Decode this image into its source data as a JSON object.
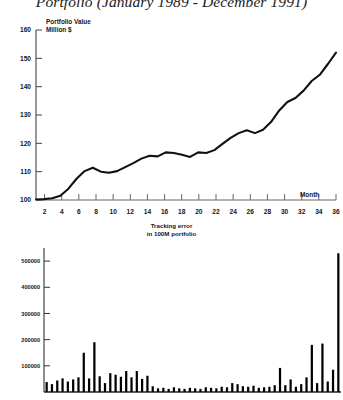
{
  "title": "Portfolio (January 1989 - December 1991)",
  "caption": {
    "line1": "Tracking error",
    "line2": "in 100M portfolio"
  },
  "colors": {
    "ink": "#111111",
    "axis": "#555555",
    "bar": "#000000",
    "background": "#ffffff"
  },
  "chart_data": [
    {
      "type": "line",
      "title": "Portfolio (January 1989 - December 1991)",
      "ylabel_line1": "Portfolio Value",
      "ylabel_line2": "Million $",
      "xlabel": "Month",
      "grid": false,
      "legend": "none",
      "xlim": [
        1,
        36
      ],
      "ylim": [
        100,
        160
      ],
      "yticks": [
        100,
        110,
        120,
        130,
        140,
        150,
        160
      ],
      "xticks": [
        2,
        4,
        6,
        8,
        10,
        12,
        14,
        16,
        18,
        20,
        22,
        24,
        26,
        28,
        30,
        32,
        34,
        36
      ],
      "x": [
        1,
        2,
        3,
        4,
        5,
        6,
        7,
        8,
        9,
        10,
        11,
        12,
        13,
        14,
        15,
        16,
        17,
        18,
        19,
        20,
        21,
        22,
        23,
        24,
        25,
        26,
        27,
        28,
        29,
        30,
        31,
        32,
        33,
        34,
        35,
        36
      ],
      "values": [
        100.2,
        100.3,
        100.6,
        101.5,
        104.0,
        107.5,
        110.2,
        111.4,
        110.0,
        109.6,
        110.2,
        111.6,
        113.0,
        114.6,
        115.6,
        115.4,
        116.8,
        116.6,
        116.0,
        115.2,
        116.8,
        116.6,
        117.6,
        119.8,
        121.9,
        123.6,
        124.6,
        123.6,
        124.8,
        127.6,
        131.6,
        134.6,
        136.0,
        138.6,
        142.0,
        144.2,
        148.0,
        152.0
      ],
      "series_name": "Portfolio Value"
    },
    {
      "type": "bar",
      "title": "Tracking error in 100M portfolio",
      "ylabel": "",
      "xlabel": "",
      "grid": false,
      "legend": "none",
      "ylim": [
        0,
        550000
      ],
      "yticks": [
        100000,
        200000,
        300000,
        400000,
        500000
      ],
      "ytick_labels": [
        "100000",
        "200000",
        "300000",
        "400000",
        "500000"
      ],
      "categories": [
        1,
        2,
        3,
        4,
        5,
        6,
        7,
        8,
        9,
        10,
        11,
        12,
        13,
        14,
        15,
        16,
        17,
        18,
        19,
        20,
        21,
        22,
        23,
        24,
        25,
        26,
        27,
        28,
        29,
        30,
        31,
        32,
        33,
        34,
        35,
        36,
        37,
        38,
        39,
        40,
        41,
        42,
        43,
        44,
        45,
        46,
        47,
        48,
        49,
        50,
        51,
        52,
        53,
        54,
        55,
        56
      ],
      "values": [
        38000,
        30000,
        44000,
        52000,
        40000,
        48000,
        56000,
        150000,
        52000,
        190000,
        60000,
        34000,
        72000,
        66000,
        58000,
        80000,
        56000,
        80000,
        50000,
        62000,
        22000,
        14000,
        16000,
        12000,
        18000,
        14000,
        12000,
        16000,
        14000,
        12000,
        18000,
        16000,
        14000,
        20000,
        18000,
        34000,
        30000,
        22000,
        20000,
        24000,
        16000,
        18000,
        20000,
        26000,
        92000,
        26000,
        48000,
        20000,
        30000,
        56000,
        180000,
        34000,
        185000,
        40000,
        85000,
        530000
      ]
    }
  ]
}
